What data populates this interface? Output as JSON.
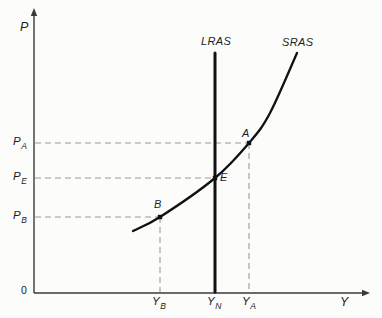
{
  "figure": {
    "background": "#fcfcfb",
    "curve_color": "#111111",
    "axis_color": "#3a3a3a",
    "dash_color": "#9a9a9a",
    "text_color": "#1c1c1c"
  },
  "labels": {
    "y_axis": "P",
    "x_axis": "Y",
    "origin": "0",
    "lras_curve": "LRAS",
    "sras_curve": "SRAS",
    "point_a": "A",
    "point_e": "E",
    "point_b": "B",
    "price_a": {
      "base": "P",
      "sub": "A"
    },
    "price_e": {
      "base": "P",
      "sub": "E"
    },
    "price_b": {
      "base": "P",
      "sub": "B"
    },
    "output_b": {
      "base": "Y",
      "sub": "B"
    },
    "output_n": {
      "base": "Y",
      "sub": "N"
    },
    "output_a": {
      "base": "Y",
      "sub": "A"
    }
  },
  "geometry": {
    "origin": {
      "x": 34,
      "y": 293
    },
    "y_axis_top": 8,
    "x_axis_right": 370,
    "lras": {
      "x": 215,
      "top": 53
    },
    "prices": {
      "pa": 143,
      "pe": 178,
      "pb": 217
    },
    "points": {
      "a": [
        249,
        143
      ],
      "e": [
        215,
        178
      ],
      "b": [
        160,
        217
      ]
    },
    "sras": [
      [
        133,
        231
      ],
      [
        160,
        217
      ],
      [
        215,
        178
      ],
      [
        249,
        143
      ],
      [
        270,
        113
      ],
      [
        297,
        53
      ]
    ]
  }
}
